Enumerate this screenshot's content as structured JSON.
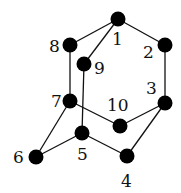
{
  "diagram": {
    "type": "graph",
    "nodes": [
      {
        "id": "1",
        "label": "1",
        "x": 118,
        "y": 19,
        "lx": 112,
        "ly": 45
      },
      {
        "id": "2",
        "label": "2",
        "x": 165,
        "y": 45,
        "lx": 143,
        "ly": 58
      },
      {
        "id": "3",
        "label": "3",
        "x": 165,
        "y": 103,
        "lx": 146,
        "ly": 94
      },
      {
        "id": "4",
        "label": "4",
        "x": 127,
        "y": 156,
        "lx": 121,
        "ly": 187
      },
      {
        "id": "5",
        "label": "5",
        "x": 82,
        "y": 133,
        "lx": 77,
        "ly": 160
      },
      {
        "id": "6",
        "label": "6",
        "x": 36,
        "y": 157,
        "lx": 13,
        "ly": 163
      },
      {
        "id": "7",
        "label": "7",
        "x": 70,
        "y": 101,
        "lx": 51,
        "ly": 107
      },
      {
        "id": "8",
        "label": "8",
        "x": 70,
        "y": 45,
        "lx": 49,
        "ly": 52
      },
      {
        "id": "9",
        "label": "9",
        "x": 84,
        "y": 64,
        "lx": 94,
        "ly": 74
      },
      {
        "id": "10",
        "label": "10",
        "x": 120,
        "y": 126,
        "lx": 107,
        "ly": 111
      }
    ],
    "edges": [
      [
        "1",
        "8"
      ],
      [
        "1",
        "9"
      ],
      [
        "1",
        "2"
      ],
      [
        "2",
        "3"
      ],
      [
        "3",
        "10"
      ],
      [
        "3",
        "4"
      ],
      [
        "8",
        "7"
      ],
      [
        "9",
        "5"
      ],
      [
        "7",
        "10"
      ],
      [
        "7",
        "6"
      ],
      [
        "6",
        "5"
      ],
      [
        "5",
        "4"
      ]
    ],
    "colors": {
      "node": "#000000",
      "edge": "#111111",
      "background": "#ffffff"
    }
  }
}
